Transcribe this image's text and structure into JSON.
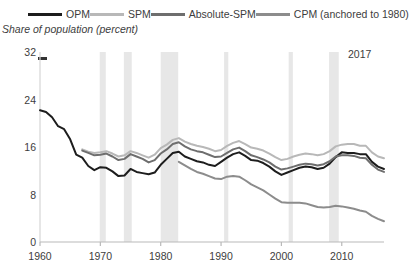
{
  "legend": {
    "items": [
      {
        "label": "OPM",
        "color": "#1d1d1d",
        "name": "legend-opm"
      },
      {
        "label": "SPM",
        "color": "#b8b8b8",
        "name": "legend-spm"
      },
      {
        "label": "Absolute-SPM",
        "color": "#6e6e6e",
        "name": "legend-absolute-spm"
      },
      {
        "label": "CPM (anchored to 1980)",
        "color": "#8c8c8c",
        "name": "legend-cpm"
      }
    ]
  },
  "axis": {
    "ylabel": "Share of population (percent)",
    "yticks": [
      "0",
      "8",
      "16",
      "24",
      "32"
    ],
    "xticks": [
      "1960",
      "1970",
      "1980",
      "1990",
      "2000",
      "2010"
    ]
  },
  "annotations": {
    "end_year": "2017"
  },
  "chart_data": {
    "type": "line",
    "title": "",
    "xlabel": "",
    "ylabel": "Share of population (percent)",
    "xlim": [
      1960,
      2017
    ],
    "ylim": [
      0,
      32
    ],
    "ytick_values": [
      0,
      8,
      16,
      24,
      32
    ],
    "xtick_values": [
      1960,
      1970,
      1980,
      1990,
      2000,
      2010
    ],
    "grid": false,
    "legend_position": "top",
    "annotations": [
      {
        "text": "2017",
        "x": 2015,
        "y": 30.5
      }
    ],
    "shaded_recessions": [
      [
        1969.9,
        1970.9
      ],
      [
        1973.9,
        1975.2
      ],
      [
        1980.0,
        1982.9
      ],
      [
        1990.5,
        1991.2
      ],
      [
        2001.2,
        2001.9
      ],
      [
        2007.9,
        2009.5
      ]
    ],
    "series": [
      {
        "name": "OPM",
        "color": "#1d1d1d",
        "x": [
          1960,
          1961,
          1962,
          1963,
          1964,
          1965,
          1966,
          1967,
          1968,
          1969,
          1970,
          1971,
          1972,
          1973,
          1974,
          1975,
          1976,
          1977,
          1978,
          1979,
          1980,
          1981,
          1982,
          1983,
          1984,
          1985,
          1986,
          1987,
          1988,
          1989,
          1990,
          1991,
          1992,
          1993,
          1994,
          1995,
          1996,
          1997,
          1998,
          1999,
          2000,
          2001,
          2002,
          2003,
          2004,
          2005,
          2006,
          2007,
          2008,
          2009,
          2010,
          2011,
          2012,
          2013,
          2014,
          2015,
          2016,
          2017
        ],
        "values": [
          22.2,
          21.9,
          21.0,
          19.5,
          19.0,
          17.3,
          14.7,
          14.2,
          12.8,
          12.1,
          12.6,
          12.5,
          11.9,
          11.1,
          11.2,
          12.3,
          11.8,
          11.6,
          11.4,
          11.7,
          13.0,
          14.0,
          15.0,
          15.2,
          14.4,
          14.0,
          13.6,
          13.4,
          13.0,
          12.8,
          13.5,
          14.2,
          14.8,
          15.1,
          14.5,
          13.8,
          13.7,
          13.3,
          12.7,
          11.9,
          11.3,
          11.7,
          12.1,
          12.5,
          12.7,
          12.6,
          12.3,
          12.5,
          13.2,
          14.3,
          15.1,
          15.0,
          15.0,
          14.8,
          14.8,
          13.5,
          12.7,
          12.3
        ]
      },
      {
        "name": "SPM",
        "color": "#b8b8b8",
        "x": [
          1967,
          1968,
          1969,
          1970,
          1971,
          1972,
          1973,
          1974,
          1975,
          1976,
          1977,
          1978,
          1979,
          1980,
          1981,
          1982,
          1983,
          1984,
          1985,
          1986,
          1987,
          1988,
          1989,
          1990,
          1991,
          1992,
          1993,
          1994,
          1995,
          1996,
          1997,
          1998,
          1999,
          2000,
          2001,
          2002,
          2003,
          2004,
          2005,
          2006,
          2007,
          2008,
          2009,
          2010,
          2011,
          2012,
          2013,
          2014,
          2015,
          2016,
          2017
        ],
        "values": [
          15.6,
          15.2,
          15.0,
          15.1,
          15.3,
          14.9,
          14.4,
          14.6,
          15.3,
          15.0,
          14.6,
          14.2,
          14.7,
          15.8,
          16.4,
          17.2,
          17.5,
          16.9,
          16.5,
          16.2,
          16.0,
          15.7,
          15.3,
          15.5,
          16.2,
          16.7,
          17.0,
          16.5,
          15.9,
          15.7,
          15.4,
          14.9,
          14.3,
          13.8,
          14.0,
          14.4,
          14.7,
          14.9,
          14.8,
          14.6,
          14.8,
          15.3,
          16.1,
          16.4,
          16.5,
          16.5,
          16.2,
          16.2,
          15.1,
          14.4,
          14.1
        ]
      },
      {
        "name": "Absolute-SPM",
        "color": "#6e6e6e",
        "x": [
          1967,
          1968,
          1969,
          1970,
          1971,
          1972,
          1973,
          1974,
          1975,
          1976,
          1977,
          1978,
          1979,
          1980,
          1981,
          1982,
          1983,
          1984,
          1985,
          1986,
          1987,
          1988,
          1989,
          1990,
          1991,
          1992,
          1993,
          1994,
          1995,
          1996,
          1997,
          1998,
          1999,
          2000,
          2001,
          2002,
          2003,
          2004,
          2005,
          2006,
          2007,
          2008,
          2009,
          2010,
          2011,
          2012,
          2013,
          2014,
          2015,
          2016,
          2017
        ],
        "values": [
          15.4,
          15.0,
          14.6,
          14.7,
          14.9,
          14.4,
          13.8,
          14.0,
          14.8,
          14.4,
          14.0,
          13.4,
          13.8,
          14.9,
          15.6,
          16.5,
          16.8,
          16.1,
          15.6,
          15.3,
          15.1,
          14.7,
          14.3,
          14.4,
          15.0,
          15.6,
          15.9,
          15.3,
          14.6,
          14.3,
          13.9,
          13.4,
          12.7,
          12.2,
          12.4,
          12.7,
          13.0,
          13.2,
          13.1,
          12.9,
          13.1,
          13.6,
          14.4,
          14.6,
          14.6,
          14.5,
          14.2,
          14.1,
          13.0,
          12.2,
          11.8
        ]
      },
      {
        "name": "CPM (anchored to 1980)",
        "color": "#8c8c8c",
        "x": [
          1983,
          1984,
          1985,
          1986,
          1987,
          1988,
          1989,
          1990,
          1991,
          1992,
          1993,
          1994,
          1995,
          1996,
          1997,
          1998,
          1999,
          2000,
          2001,
          2002,
          2003,
          2004,
          2005,
          2006,
          2007,
          2008,
          2009,
          2010,
          2011,
          2012,
          2013,
          2014,
          2015,
          2016,
          2017
        ],
        "values": [
          13.5,
          12.9,
          12.3,
          11.8,
          11.5,
          11.1,
          10.7,
          10.6,
          11.0,
          11.1,
          11.0,
          10.4,
          9.7,
          9.2,
          8.7,
          8.0,
          7.3,
          6.7,
          6.6,
          6.6,
          6.6,
          6.5,
          6.2,
          5.9,
          5.8,
          5.9,
          6.1,
          6.0,
          5.8,
          5.6,
          5.3,
          5.1,
          4.4,
          3.9,
          3.5
        ]
      }
    ]
  }
}
